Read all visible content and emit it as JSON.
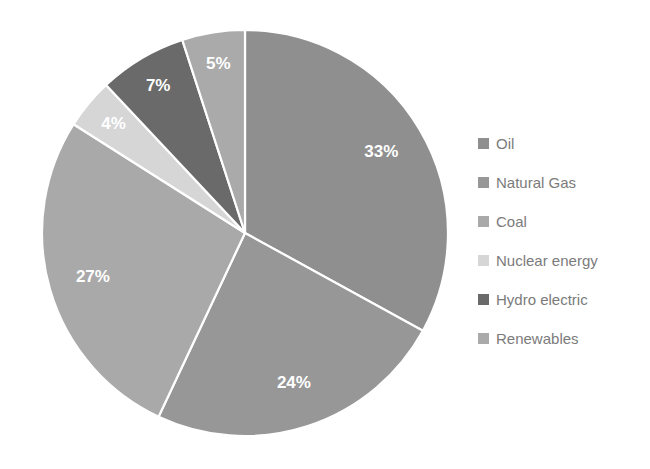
{
  "chart_data": {
    "type": "pie",
    "title": "",
    "subtitle": "",
    "xlabel": "",
    "ylabel": "",
    "categories": [
      "Oil",
      "Natural Gas",
      "Coal",
      "Nuclear energy",
      "Hydro electric",
      "Renewables"
    ],
    "values": [
      33,
      24,
      27,
      4,
      7,
      5
    ],
    "value_suffix": "%",
    "data_labels": [
      "33%",
      "24%",
      "27%",
      "4%",
      "7%",
      "5%"
    ],
    "slice_colors": [
      "#8f8f8f",
      "#979797",
      "#a9a9a9",
      "#d6d6d6",
      "#6a6a6a",
      "#aaaaaa"
    ],
    "start_angle_deg": 0,
    "direction": "clockwise",
    "legend_position": "right",
    "grid": false,
    "slices": [
      {
        "label": "Oil",
        "value": 33,
        "data_label": "33%",
        "color": "#8f8f8f",
        "label_color": "#ffffff"
      },
      {
        "label": "Natural Gas",
        "value": 24,
        "data_label": "24%",
        "color": "#979797",
        "label_color": "#ffffff"
      },
      {
        "label": "Coal",
        "value": 27,
        "data_label": "27%",
        "color": "#a9a9a9",
        "label_color": "#ffffff"
      },
      {
        "label": "Nuclear energy",
        "value": 4,
        "data_label": "4%",
        "color": "#d6d6d6",
        "label_color": "#ffffff"
      },
      {
        "label": "Hydro electric",
        "value": 7,
        "data_label": "7%",
        "color": "#6a6a6a",
        "label_color": "#ffffff"
      },
      {
        "label": "Renewables",
        "value": 5,
        "data_label": "5%",
        "color": "#aaaaaa",
        "label_color": "#ffffff"
      }
    ]
  },
  "legend": {
    "items": [
      {
        "label": "Oil",
        "color": "#8f8f8f"
      },
      {
        "label": "Natural Gas",
        "color": "#979797"
      },
      {
        "label": "Coal",
        "color": "#a9a9a9"
      },
      {
        "label": "Nuclear energy",
        "color": "#d6d6d6"
      },
      {
        "label": "Hydro electric",
        "color": "#6a6a6a"
      },
      {
        "label": "Renewables",
        "color": "#aaaaaa"
      }
    ]
  },
  "geometry": {
    "center_x": 245,
    "center_y": 233,
    "radius": 203
  },
  "colors": {
    "background": "#ffffff",
    "legend_text": "#7b7b7b",
    "slice_separator": "#ffffff",
    "data_label_text": "#ffffff"
  }
}
